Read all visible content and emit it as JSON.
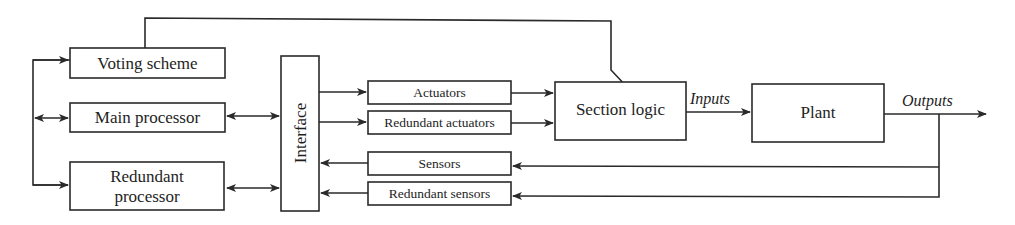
{
  "diagram": {
    "colors": {
      "stroke": "#2a2a2a",
      "text": "#1e1e1e",
      "background": "#ffffff"
    },
    "blocks": {
      "voting_scheme": "Voting scheme",
      "main_processor": "Main processor",
      "redundant_processor_line1": "Redundant",
      "redundant_processor_line2": "processor",
      "interface": "Interface",
      "actuators": "Actuators",
      "redundant_actuators": "Redundant actuators",
      "sensors": "Sensors",
      "redundant_sensors": "Redundant sensors",
      "section_logic": "Section logic",
      "plant": "Plant"
    },
    "signals": {
      "inputs": "Inputs",
      "outputs": "Outputs"
    },
    "connections": [
      {
        "from": "left-bus",
        "to": "voting_scheme",
        "type": "arrow"
      },
      {
        "from": "left-bus",
        "to": "main_processor",
        "type": "bidirectional"
      },
      {
        "from": "left-bus",
        "to": "redundant_processor",
        "type": "arrow"
      },
      {
        "from": "main_processor",
        "to": "interface",
        "type": "bidirectional"
      },
      {
        "from": "redundant_processor",
        "to": "interface",
        "type": "bidirectional"
      },
      {
        "from": "interface",
        "to": "actuators",
        "type": "arrow"
      },
      {
        "from": "interface",
        "to": "redundant_actuators",
        "type": "arrow"
      },
      {
        "from": "actuators",
        "to": "section_logic",
        "type": "arrow"
      },
      {
        "from": "redundant_actuators",
        "to": "section_logic",
        "type": "arrow"
      },
      {
        "from": "voting_scheme",
        "to": "section_logic",
        "type": "arrow"
      },
      {
        "from": "section_logic",
        "to": "plant",
        "type": "arrow",
        "label": "Inputs"
      },
      {
        "from": "plant",
        "to": "output",
        "type": "arrow",
        "label": "Outputs"
      },
      {
        "from": "outputs",
        "to": "sensors",
        "type": "arrow"
      },
      {
        "from": "outputs",
        "to": "redundant_sensors",
        "type": "arrow"
      },
      {
        "from": "sensors",
        "to": "interface",
        "type": "arrow"
      },
      {
        "from": "redundant_sensors",
        "to": "interface",
        "type": "arrow"
      }
    ]
  }
}
